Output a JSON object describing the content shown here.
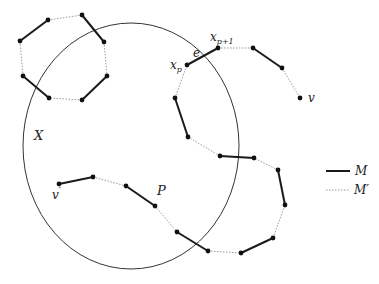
{
  "diagram": {
    "colors": {
      "stroke": "#1a1a1a",
      "dotted": "#9a9a9a",
      "node": "#111111",
      "ellipse": "#333333"
    },
    "ellipse": {
      "cx": 131,
      "cy": 146,
      "rx": 108,
      "ry": 123,
      "label": "X",
      "label_pos": [
        34,
        140
      ]
    },
    "cycle": {
      "nodes": [
        [
          48,
          20
        ],
        [
          82,
          15
        ],
        [
          104,
          42
        ],
        [
          107,
          76
        ],
        [
          82,
          100
        ],
        [
          49,
          98
        ],
        [
          23,
          76
        ],
        [
          20,
          41
        ]
      ],
      "edges": [
        {
          "from": 7,
          "to": 0,
          "type": "M"
        },
        {
          "from": 0,
          "to": 1,
          "type": "M'"
        },
        {
          "from": 1,
          "to": 2,
          "type": "M"
        },
        {
          "from": 2,
          "to": 3,
          "type": "M'"
        },
        {
          "from": 3,
          "to": 4,
          "type": "M"
        },
        {
          "from": 4,
          "to": 5,
          "type": "M'"
        },
        {
          "from": 5,
          "to": 6,
          "type": "M"
        },
        {
          "from": 6,
          "to": 7,
          "type": "M'"
        }
      ]
    },
    "path": {
      "label": "P",
      "label_pos": [
        157,
        195
      ],
      "nodes": [
        [
          59,
          184
        ],
        [
          93,
          177
        ],
        [
          126,
          186
        ],
        [
          155,
          206
        ],
        [
          177,
          232
        ],
        [
          208,
          251
        ],
        [
          241,
          253
        ],
        [
          273,
          238
        ],
        [
          285,
          205
        ],
        [
          278,
          170
        ],
        [
          254,
          158
        ],
        [
          220,
          156
        ],
        [
          188,
          137
        ],
        [
          175,
          98
        ],
        [
          187,
          65
        ],
        [
          218,
          48
        ],
        [
          253,
          48
        ],
        [
          282,
          68
        ],
        [
          300,
          98
        ]
      ],
      "edge_types": [
        "M",
        "M'",
        "M",
        "M'",
        "M",
        "M'",
        "M",
        "M'",
        "M",
        "M'",
        "M",
        "M'",
        "M",
        "M'",
        "M",
        "M'",
        "M",
        "M'"
      ]
    },
    "labels": [
      {
        "text": "v'",
        "x": 52,
        "y": 198
      },
      {
        "text": "v",
        "x": 308,
        "y": 102
      },
      {
        "text": "x_p",
        "x": 172,
        "y": 69
      },
      {
        "text": "x_{p+1}",
        "x": 210,
        "y": 41
      },
      {
        "text": "e",
        "x": 193,
        "y": 56
      }
    ],
    "legend": {
      "items": [
        {
          "type": "M",
          "label": "M"
        },
        {
          "type": "M'",
          "label": "M′"
        }
      ]
    }
  }
}
